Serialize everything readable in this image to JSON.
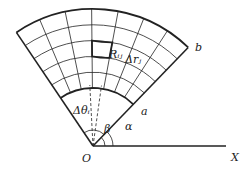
{
  "labels": {
    "origin": "O",
    "x_axis": "X",
    "inner_radius": "a",
    "outer_radius": "b",
    "alpha": "α",
    "beta": "β",
    "delta_theta": "Δθᵢ",
    "region": "Rᵢⱼ",
    "delta_r": "Δrⱼ"
  },
  "geometry": {
    "origin": [
      93,
      146
    ],
    "inner_r": 58,
    "outer_r": 137,
    "alpha_deg": 46,
    "beta_deg": 124,
    "sectors": 7,
    "bands": 5,
    "colors": {
      "line": "#222222",
      "background": "#ffffff"
    }
  }
}
